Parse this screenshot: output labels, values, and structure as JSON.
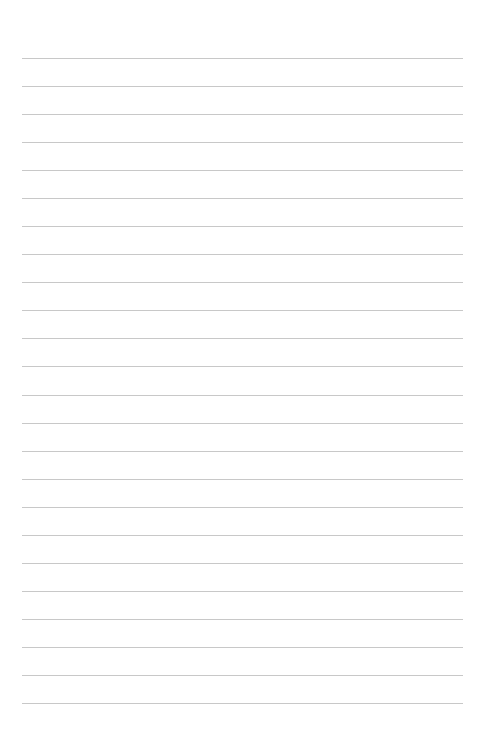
{
  "page": {
    "type": "lined-paper",
    "background_color": "#ffffff",
    "line_color": "#c8c8c8",
    "line_count": 24
  }
}
